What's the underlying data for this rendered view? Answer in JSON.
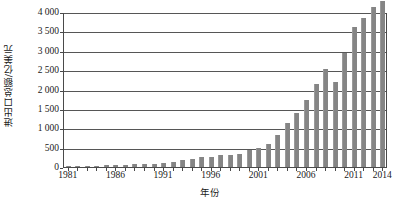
{
  "chart_data": {
    "type": "bar",
    "title": "",
    "xlabel": "年份",
    "ylabel": "进出口总额/亿美元",
    "ylim": [
      0,
      4000
    ],
    "ytick_values": [
      0,
      500,
      1000,
      1500,
      2000,
      2500,
      3000,
      3500,
      4000
    ],
    "ytick_labels": [
      "0",
      "500",
      "1 000",
      "1 500",
      "2 000",
      "2 500",
      "3 000",
      "3 500",
      "4 000"
    ],
    "grid": true,
    "legend": "none",
    "bar_color": "#858585",
    "xtick_labels": [
      "1981",
      "1986",
      "1991",
      "1996",
      "2001",
      "2006",
      "2011",
      "2014"
    ],
    "categories": [
      "1981",
      "1982",
      "1983",
      "1984",
      "1985",
      "1986",
      "1987",
      "1988",
      "1989",
      "1990",
      "1991",
      "1992",
      "1993",
      "1994",
      "1995",
      "1996",
      "1997",
      "1998",
      "1999",
      "2000",
      "2001",
      "2002",
      "2003",
      "2004",
      "2005",
      "2006",
      "2007",
      "2008",
      "2009",
      "2010",
      "2011",
      "2012",
      "2013",
      "2014"
    ],
    "values": [
      440,
      416,
      436,
      535,
      696,
      738,
      827,
      1028,
      1117,
      1154,
      1357,
      1656,
      1957,
      2366,
      2808,
      2899,
      3252,
      3240,
      3607,
      4743,
      5097,
      6208,
      8510,
      11546,
      14219,
      17604,
      21738,
      25633,
      22075,
      29740,
      36419,
      38671,
      41590,
      43030
    ],
    "values_display_unit": "亿美元",
    "plot_values": [
      44,
      42,
      44,
      54,
      70,
      74,
      83,
      103,
      112,
      115,
      136,
      166,
      196,
      237,
      281,
      290,
      325,
      324,
      361,
      474,
      510,
      621,
      851,
      1155,
      1422,
      1760,
      2174,
      2563,
      2207,
      2974,
      3642,
      3867,
      4159,
      4303
    ]
  }
}
